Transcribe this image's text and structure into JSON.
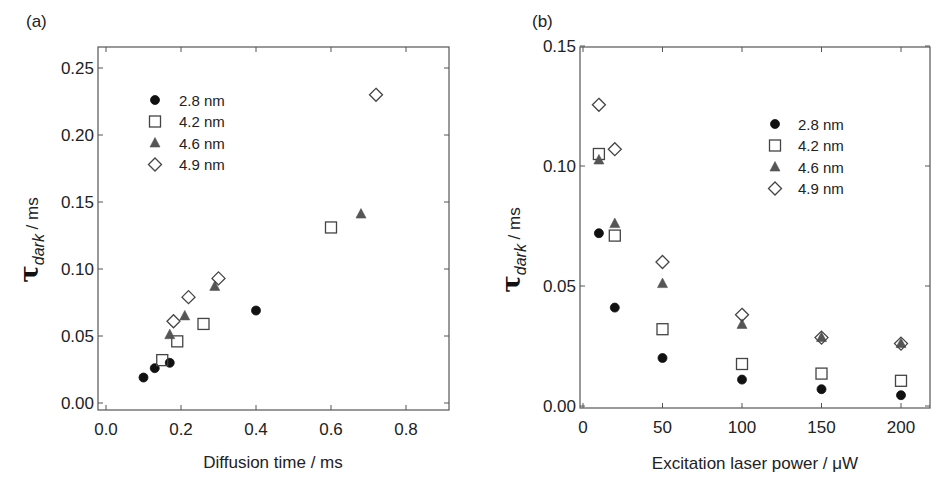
{
  "chart_data": [
    {
      "panel": "(a)",
      "type": "scatter",
      "title": "",
      "xlabel": "Diffusion time / ms",
      "ylabel": "τdark / ms",
      "ylabel_parts": {
        "symbol": "τ",
        "subscript": "dark",
        "unit": " / ms"
      },
      "xlim": [
        -0.02,
        0.92
      ],
      "ylim": [
        -0.005,
        0.265
      ],
      "xticks": [
        0.0,
        0.2,
        0.4,
        0.6,
        0.8
      ],
      "xtick_labels": [
        "0.0",
        "0.2",
        "0.4",
        "0.6",
        "0.8"
      ],
      "yticks": [
        0.0,
        0.05,
        0.1,
        0.15,
        0.2,
        0.25
      ],
      "ytick_labels": [
        "0.00",
        "0.05",
        "0.10",
        "0.15",
        "0.20",
        "0.25"
      ],
      "grid": false,
      "legend_position": "upper left",
      "series": [
        {
          "name": "2.8 nm",
          "marker": "circle-filled",
          "color": "#111111",
          "x": [
            0.1,
            0.13,
            0.17,
            0.4
          ],
          "y": [
            0.019,
            0.026,
            0.03,
            0.069
          ]
        },
        {
          "name": "4.2 nm",
          "marker": "square-open",
          "color": "#444444",
          "x": [
            0.15,
            0.19,
            0.26,
            0.6
          ],
          "y": [
            0.032,
            0.046,
            0.059,
            0.131
          ]
        },
        {
          "name": "4.6 nm",
          "marker": "triangle-filled",
          "color": "#555555",
          "x": [
            0.17,
            0.21,
            0.29,
            0.68
          ],
          "y": [
            0.051,
            0.065,
            0.087,
            0.141
          ]
        },
        {
          "name": "4.9 nm",
          "marker": "diamond-open",
          "color": "#444444",
          "x": [
            0.18,
            0.22,
            0.3,
            0.72
          ],
          "y": [
            0.061,
            0.079,
            0.093,
            0.23
          ]
        }
      ]
    },
    {
      "panel": "(b)",
      "type": "scatter",
      "title": "",
      "xlabel": "Excitation laser power / μW",
      "ylabel": "τdark / ms",
      "ylabel_parts": {
        "symbol": "τ",
        "subscript": "dark",
        "unit": " / ms"
      },
      "xlim": [
        -2,
        220
      ],
      "ylim": [
        0.0,
        0.15
      ],
      "xticks": [
        0,
        50,
        100,
        150,
        200
      ],
      "xtick_labels": [
        "0",
        "50",
        "100",
        "150",
        "200"
      ],
      "yticks": [
        0.0,
        0.05,
        0.1,
        0.15
      ],
      "ytick_labels": [
        "0.00",
        "0.05",
        "0.10",
        "0.15"
      ],
      "grid": false,
      "legend_position": "upper right",
      "series": [
        {
          "name": "2.8 nm",
          "marker": "circle-filled",
          "color": "#111111",
          "x": [
            10,
            20,
            50,
            100,
            150,
            200
          ],
          "y": [
            0.072,
            0.041,
            0.02,
            0.011,
            0.007,
            0.0045
          ]
        },
        {
          "name": "4.2 nm",
          "marker": "square-open",
          "color": "#444444",
          "x": [
            10,
            20,
            50,
            100,
            150,
            200
          ],
          "y": [
            0.105,
            0.071,
            0.032,
            0.0175,
            0.0135,
            0.0105
          ]
        },
        {
          "name": "4.6 nm",
          "marker": "triangle-filled",
          "color": "#555555",
          "x": [
            10,
            20,
            50,
            100,
            150,
            200
          ],
          "y": [
            0.1025,
            0.076,
            0.051,
            0.034,
            0.0285,
            0.026
          ]
        },
        {
          "name": "4.9 nm",
          "marker": "diamond-open",
          "color": "#444444",
          "x": [
            10,
            20,
            50,
            100,
            150,
            200
          ],
          "y": [
            0.1255,
            0.107,
            0.06,
            0.038,
            0.0285,
            0.026
          ]
        }
      ]
    }
  ],
  "layout": {
    "panels": [
      {
        "box": {
          "left": 98,
          "top": 47,
          "right": 449,
          "bottom": 410
        },
        "xmap": {
          "v0": 0.0,
          "p0": 106,
          "v1": 0.8,
          "p1": 406
        },
        "ymap": {
          "v0": 0.0,
          "p0": 403,
          "v1": 0.25,
          "p1": 68
        },
        "label_pos": [
          26,
          27
        ],
        "legend": {
          "sym_x": 155,
          "text_x": 179,
          "y0": 100,
          "dy": 21.5
        },
        "xtitle_pos": [
          273,
          468
        ],
        "ylabel_pos": [
          38,
          240
        ]
      },
      {
        "box": {
          "left": 580,
          "top": 47,
          "right": 930,
          "bottom": 408
        },
        "xmap": {
          "v0": 0,
          "p0": 583,
          "v1": 200,
          "p1": 901
        },
        "ymap": {
          "v0": 0.0,
          "p0": 406,
          "v1": 0.15,
          "p1": 46
        },
        "label_pos": [
          532,
          27
        ],
        "legend": {
          "sym_x": 775,
          "text_x": 798,
          "y0": 124,
          "dy": 21.5
        },
        "xtitle_pos": [
          755,
          469
        ],
        "ylabel_pos": [
          520,
          250
        ]
      }
    ]
  }
}
